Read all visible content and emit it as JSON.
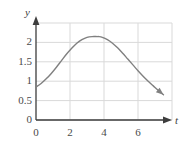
{
  "figure": {
    "background_color": "#ffffff",
    "width": 184,
    "height": 147
  },
  "chart_data": {
    "type": "line",
    "title": "",
    "subtitle": "",
    "xlabel": "t",
    "ylabel": "y",
    "xlim": [
      0,
      8
    ],
    "ylim": [
      0,
      2.5
    ],
    "grid": true,
    "legend": null,
    "legend_position": "none",
    "x_ticks": [
      0,
      2,
      4,
      6
    ],
    "x_tick_labels": [
      "0",
      "2",
      "4",
      "6"
    ],
    "y_ticks": [
      0,
      0.5,
      1,
      1.5,
      2
    ],
    "y_tick_labels": [
      "0",
      "0.5",
      "1",
      "1.5",
      "2"
    ],
    "grid_color": "#d9d9d9",
    "axis_color": "#3d3d3d",
    "curve_color": "#808080",
    "curve_width": 1.4,
    "series": [
      {
        "name": "y(t)",
        "arrow_end": true,
        "x": [
          0.0,
          0.3,
          0.6,
          0.9,
          1.2,
          1.5,
          1.8,
          2.1,
          2.4,
          2.7,
          3.0,
          3.3,
          3.6,
          3.7,
          3.9,
          4.2,
          4.5,
          4.8,
          5.1,
          5.4,
          5.7,
          6.0,
          6.3,
          6.6,
          6.9,
          7.2,
          7.5
        ],
        "y": [
          0.85,
          0.94,
          1.06,
          1.2,
          1.36,
          1.53,
          1.7,
          1.85,
          1.98,
          2.07,
          2.13,
          2.15,
          2.15,
          2.15,
          2.13,
          2.07,
          1.98,
          1.86,
          1.72,
          1.57,
          1.42,
          1.27,
          1.13,
          1.0,
          0.88,
          0.76,
          0.65
        ]
      }
    ],
    "annotations": {
      "peak_t": 3.7,
      "peak_y": 2.15,
      "start_y": 0.85,
      "end_t": 7.5,
      "end_y": 0.65
    }
  },
  "axis_labels": {
    "y_axis_name": "y",
    "x_axis_name": "t"
  }
}
